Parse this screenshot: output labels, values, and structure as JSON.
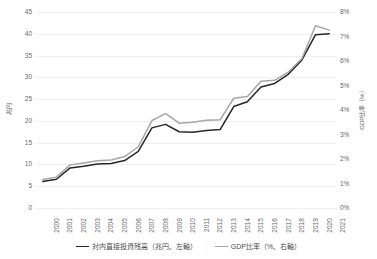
{
  "chart_data": {
    "type": "line",
    "title": "",
    "xlabel": "",
    "ylabel": "兆円",
    "y2label": "GDP比率（%）",
    "grid": true,
    "legend_position": "bottom",
    "categories": [
      "2000",
      "2001",
      "2002",
      "2003",
      "2004",
      "2005",
      "2006",
      "2007",
      "2008",
      "2009",
      "2010",
      "2011",
      "2012",
      "2013",
      "2014",
      "2015",
      "2016",
      "2017",
      "2018",
      "2019",
      "2020",
      "2021"
    ],
    "ylim": [
      0,
      45
    ],
    "yticks": [
      "0",
      "5",
      "10",
      "15",
      "20",
      "25",
      "30",
      "35",
      "40",
      "45"
    ],
    "y2lim": [
      0,
      8
    ],
    "y2ticks": [
      "0%",
      "1%",
      "2%",
      "3%",
      "4%",
      "5%",
      "6%",
      "7%",
      "8%"
    ],
    "series": [
      {
        "name": "対内直接投資残高（兆円、左軸）",
        "axis": "left",
        "color": "#262626",
        "values": [
          6.1,
          6.6,
          9.2,
          9.6,
          10.1,
          10.2,
          10.9,
          13.0,
          18.4,
          19.2,
          17.5,
          17.4,
          17.8,
          18.0,
          23.3,
          24.4,
          27.8,
          28.6,
          30.7,
          34.0,
          39.8,
          40.0
        ]
      },
      {
        "name": "GDP比率（%、右軸）",
        "axis": "right",
        "color": "#a6a6a6",
        "values": [
          1.16,
          1.26,
          1.76,
          1.84,
          1.93,
          1.96,
          2.1,
          2.5,
          3.57,
          3.85,
          3.46,
          3.5,
          3.58,
          3.6,
          4.48,
          4.55,
          5.17,
          5.21,
          5.55,
          6.1,
          7.44,
          7.26
        ]
      }
    ]
  },
  "legend": {
    "items": [
      {
        "label": "対内直接投資残高（兆円、左軸）",
        "color": "#262626"
      },
      {
        "label": "GDP比率（%、右軸）",
        "color": "#a6a6a6"
      }
    ]
  },
  "axes": {
    "left_title": "兆円",
    "right_title": "GDP比率（%）"
  }
}
